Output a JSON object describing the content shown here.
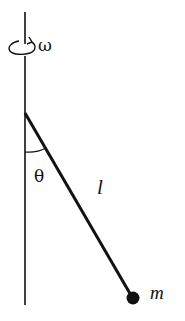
{
  "diagram": {
    "type": "rotating-pendulum",
    "labels": {
      "angular_velocity": "ω",
      "angle": "θ",
      "length": "l",
      "mass": "m"
    },
    "colors": {
      "stroke": "#111111",
      "background": "#ffffff"
    }
  }
}
